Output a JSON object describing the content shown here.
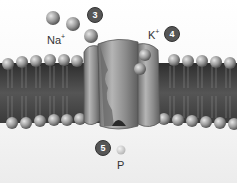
{
  "diagram": {
    "labels": {
      "sodium": "Na",
      "sodium_charge": "+",
      "potassium": "K",
      "potassium_charge": "+",
      "phosphate": "P"
    },
    "steps": [
      {
        "number": "3"
      },
      {
        "number": "4"
      },
      {
        "number": "5"
      }
    ],
    "colors": {
      "ion": "#9a9a9a",
      "membrane_dark": "#3a3a3a",
      "protein": "#8c8c8c",
      "badge": "#555555"
    }
  }
}
